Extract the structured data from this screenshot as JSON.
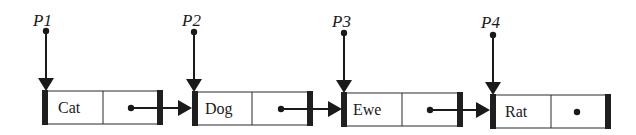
{
  "diagram": {
    "type": "linked-list",
    "colors": {
      "ink": "#1a1a1a",
      "background": "#ffffff"
    },
    "pointers": [
      {
        "label": "P1",
        "targets_node": 0
      },
      {
        "label": "P2",
        "targets_node": 1
      },
      {
        "label": "P3",
        "targets_node": 2
      },
      {
        "label": "P4",
        "targets_node": 3
      }
    ],
    "nodes": [
      {
        "value": "Cat",
        "next": 1
      },
      {
        "value": "Dog",
        "next": 2
      },
      {
        "value": "Ewe",
        "next": 3
      },
      {
        "value": "Rat",
        "next": null
      }
    ]
  }
}
